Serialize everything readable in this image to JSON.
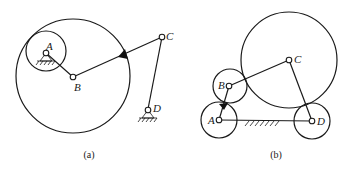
{
  "figure_a": {
    "caption": "(a)",
    "labels": {
      "A": "A",
      "B": "B",
      "C": "C",
      "D": "D"
    },
    "components": [
      "large circle centred at B",
      "small circle centred at A",
      "link AB",
      "link BC",
      "link CD",
      "ground pivot A",
      "ground pivot D",
      "black wedge on BC at large circle"
    ]
  },
  "figure_b": {
    "caption": "(b)",
    "labels": {
      "A": "A",
      "B": "B",
      "C": "C",
      "D": "D"
    },
    "components": [
      "large circle centred at C",
      "circle centred at B",
      "circle centred at A",
      "circle centred at D",
      "link AB",
      "link BC",
      "link CD",
      "ground line AD",
      "black wedge between A and B"
    ]
  },
  "colors": {
    "stroke": "#1a1a1a",
    "background": "#ffffff",
    "wedge": "#111111"
  }
}
